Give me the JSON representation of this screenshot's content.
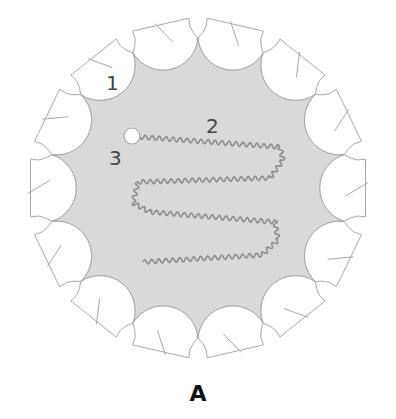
{
  "panel_label": "A",
  "colors": {
    "background": "#ffffff",
    "fill_region": "#d9d9d9",
    "tab_fill": "#ffffff",
    "outline": "#a8a8a8",
    "wave_line": "#8c8c8c",
    "label_text": "#444444"
  },
  "geometry": {
    "center_x": 198,
    "center_y": 188,
    "tab_count": 14,
    "cusp_radius": 150,
    "tab_outer_radius": 170,
    "tab_half_width": 30,
    "start_angle_deg": -90
  },
  "labels": [
    {
      "id": "1",
      "text": "1",
      "x": 106,
      "y": 90
    },
    {
      "id": "2",
      "text": "2",
      "x": 206,
      "y": 133
    },
    {
      "id": "3",
      "text": "3",
      "x": 109,
      "y": 165
    }
  ],
  "marker": {
    "name": "start-circle",
    "x": 132,
    "y": 136,
    "r": 8
  },
  "wave_path": {
    "points": [
      [
        140,
        137
      ],
      [
        280,
        147
      ],
      [
        283,
        160
      ],
      [
        270,
        178
      ],
      [
        138,
        182
      ],
      [
        133,
        203
      ],
      [
        150,
        212
      ],
      [
        275,
        222
      ],
      [
        278,
        240
      ],
      [
        262,
        255
      ],
      [
        143,
        262
      ]
    ],
    "amplitude": 2.2,
    "wavelength": 7
  }
}
